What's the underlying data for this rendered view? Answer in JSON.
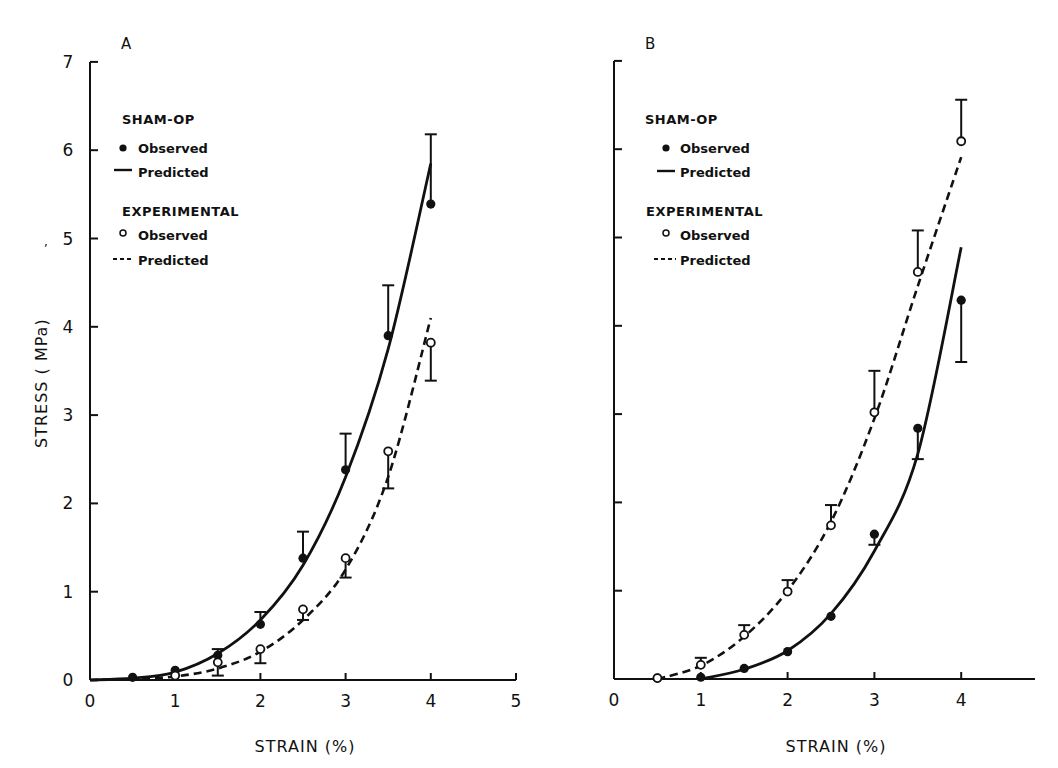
{
  "figure": {
    "y_axis_label": "STRESS ( MPa)",
    "x_axis_label": "STRAIN (%)"
  },
  "legend": {
    "group1_title": "SHAM-OP",
    "group1_observed": "Observed",
    "group1_predicted": "Predicted",
    "group2_title": "EXPERIMENTAL",
    "group2_observed": "Observed",
    "group2_predicted": "Predicted"
  },
  "chart_data": [
    {
      "panel": "A",
      "type": "line",
      "title": "A",
      "xlabel": "STRAIN (%)",
      "ylabel": "STRESS ( MPa)",
      "xlim": [
        0,
        5
      ],
      "ylim": [
        0,
        7
      ],
      "xticks": [
        0,
        1,
        2,
        3,
        4,
        5
      ],
      "yticks": [
        0,
        1,
        2,
        3,
        4,
        5,
        6,
        7
      ],
      "legend_position": "upper-left",
      "series": [
        {
          "name": "SHAM-OP Observed",
          "marker": "filled-circle",
          "x": [
            0.5,
            1.0,
            1.5,
            2.0,
            2.5,
            3.0,
            3.5,
            4.0
          ],
          "y": [
            0.03,
            0.11,
            0.28,
            0.63,
            1.38,
            2.38,
            3.9,
            5.39
          ],
          "error": [
            null,
            null,
            0.07,
            0.14,
            0.3,
            0.41,
            0.57,
            0.79
          ],
          "error_direction": "up"
        },
        {
          "name": "SHAM-OP Predicted",
          "line": "solid",
          "x": [
            0,
            0.5,
            1.0,
            1.5,
            2.0,
            2.5,
            3.0,
            3.5,
            4.0
          ],
          "y": [
            0,
            0.02,
            0.09,
            0.3,
            0.68,
            1.3,
            2.3,
            3.75,
            5.85
          ]
        },
        {
          "name": "EXPERIMENTAL Observed",
          "marker": "open-circle",
          "x": [
            1.0,
            1.5,
            2.0,
            2.5,
            3.0,
            3.5,
            4.0
          ],
          "y": [
            0.05,
            0.2,
            0.35,
            0.8,
            1.38,
            2.59,
            3.82
          ],
          "error": [
            null,
            0.15,
            0.16,
            0.12,
            0.22,
            0.42,
            0.43
          ],
          "error_direction": "down"
        },
        {
          "name": "EXPERIMENTAL Predicted",
          "line": "dashed",
          "x": [
            0,
            0.5,
            1.0,
            1.5,
            2.0,
            2.5,
            3.0,
            3.5,
            4.0
          ],
          "y": [
            0,
            0.01,
            0.04,
            0.13,
            0.32,
            0.68,
            1.25,
            2.3,
            4.1
          ]
        }
      ]
    },
    {
      "panel": "B",
      "type": "line",
      "title": "B",
      "xlabel": "STRAIN (%)",
      "ylabel": "STRESS ( MPa)",
      "xlim": [
        0,
        4.8
      ],
      "ylim": [
        0,
        7
      ],
      "xticks": [
        0,
        1,
        2,
        3,
        4
      ],
      "yticks": [
        0,
        1,
        2,
        3,
        4,
        5,
        6,
        7
      ],
      "legend_position": "upper-left",
      "series": [
        {
          "name": "SHAM-OP Observed",
          "marker": "filled-circle",
          "x": [
            0.5,
            1.0,
            1.5,
            2.0,
            2.5,
            3.0,
            3.5,
            4.0
          ],
          "y": [
            0.01,
            0.02,
            0.12,
            0.31,
            0.71,
            1.64,
            2.84,
            4.29
          ],
          "error": [
            null,
            null,
            null,
            null,
            null,
            0.12,
            0.35,
            0.7
          ],
          "error_direction": "down"
        },
        {
          "name": "SHAM-OP Predicted",
          "line": "solid",
          "x": [
            1.0,
            1.5,
            2.0,
            2.5,
            3.0,
            3.5,
            4.0
          ],
          "y": [
            0,
            0.11,
            0.32,
            0.74,
            1.45,
            2.55,
            4.89
          ]
        },
        {
          "name": "EXPERIMENTAL Observed",
          "marker": "open-circle",
          "x": [
            0.5,
            1.0,
            1.5,
            2.0,
            2.5,
            3.0,
            3.5,
            4.0
          ],
          "y": [
            0.01,
            0.16,
            0.5,
            0.99,
            1.74,
            3.02,
            4.61,
            6.09
          ],
          "error": [
            null,
            0.08,
            0.11,
            0.13,
            0.23,
            0.47,
            0.47,
            0.47
          ],
          "error_direction": "up"
        },
        {
          "name": "EXPERIMENTAL Predicted",
          "line": "dashed",
          "x": [
            0.5,
            1.0,
            1.5,
            2.0,
            2.5,
            3.0,
            3.5,
            4.0
          ],
          "y": [
            0,
            0.15,
            0.48,
            1.0,
            1.78,
            2.95,
            4.45,
            5.91
          ]
        }
      ]
    }
  ]
}
